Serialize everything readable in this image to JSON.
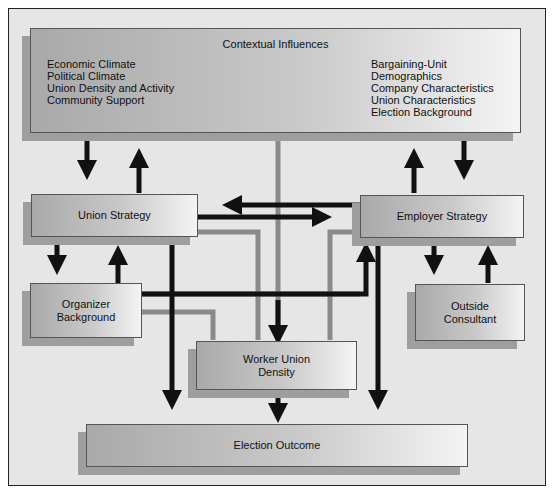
{
  "diagram": {
    "context": {
      "title": "Contextual Influences",
      "left_items": [
        "Economic Climate",
        "Political Climate",
        "Union Density and Activity",
        "Community Support"
      ],
      "right_items": [
        "Bargaining-Unit Demographics",
        "Company Characteristics",
        "Union Characteristics",
        "Election Background"
      ]
    },
    "union_strategy": "Union Strategy",
    "employer_strategy": "Employer Strategy",
    "organizer_background": [
      "Organizer",
      "Background"
    ],
    "outside_consultant": [
      "Outside",
      "Consultant"
    ],
    "worker_union_density": [
      "Worker Union",
      "Density"
    ],
    "election_outcome": "Election Outcome"
  }
}
